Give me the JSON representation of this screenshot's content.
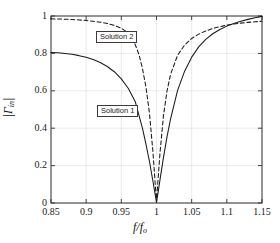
{
  "chart_data": {
    "type": "line",
    "title": "",
    "xlabel": "f/fₒ",
    "ylabel": "|Γin|",
    "xlim": [
      0.85,
      1.15
    ],
    "ylim": [
      0,
      1
    ],
    "grid": true,
    "legend_position": "inline-annotations",
    "xticks": [
      "0.85",
      "0.9",
      "0.95",
      "1",
      "1.05",
      "1.1",
      "1.15"
    ],
    "xtick_values": [
      0.85,
      0.9,
      0.95,
      1,
      1.05,
      1.1,
      1.15
    ],
    "yticks": [
      "0",
      "0.2",
      "0.4",
      "0.6",
      "0.8",
      "1"
    ],
    "ytick_values": [
      0,
      0.2,
      0.4,
      0.6,
      0.8,
      1
    ],
    "series": [
      {
        "name": "Solution 1",
        "style": "solid",
        "color": "#1a1a1a",
        "x": [
          0.85,
          0.86,
          0.87,
          0.88,
          0.89,
          0.9,
          0.91,
          0.92,
          0.93,
          0.94,
          0.95,
          0.96,
          0.97,
          0.98,
          0.985,
          0.99,
          0.995,
          0.998,
          1.0,
          1.002,
          1.005,
          1.01,
          1.015,
          1.02,
          1.03,
          1.04,
          1.05,
          1.06,
          1.07,
          1.08,
          1.09,
          1.1,
          1.11,
          1.12,
          1.13,
          1.14,
          1.15
        ],
        "y": [
          0.805,
          0.803,
          0.8,
          0.795,
          0.788,
          0.779,
          0.767,
          0.751,
          0.73,
          0.702,
          0.664,
          0.612,
          0.54,
          0.4,
          0.315,
          0.222,
          0.115,
          0.047,
          0.005,
          0.05,
          0.125,
          0.245,
          0.355,
          0.45,
          0.602,
          0.705,
          0.78,
          0.835,
          0.875,
          0.905,
          0.928,
          0.946,
          0.96,
          0.972,
          0.982,
          0.991,
          0.998
        ]
      },
      {
        "name": "Solution 2",
        "style": "dashed",
        "color": "#1a1a1a",
        "x": [
          0.85,
          0.86,
          0.87,
          0.88,
          0.89,
          0.9,
          0.91,
          0.92,
          0.93,
          0.94,
          0.95,
          0.955,
          0.96,
          0.965,
          0.97,
          0.975,
          0.98,
          0.985,
          0.99,
          0.995,
          0.998,
          1.0,
          1.002,
          1.005,
          1.01,
          1.015,
          1.02,
          1.03,
          1.04,
          1.05,
          1.06,
          1.07,
          1.08,
          1.09,
          1.1,
          1.11,
          1.12,
          1.13,
          1.14,
          1.15
        ],
        "y": [
          0.985,
          0.984,
          0.983,
          0.981,
          0.979,
          0.976,
          0.972,
          0.967,
          0.96,
          0.95,
          0.935,
          0.922,
          0.905,
          0.88,
          0.845,
          0.795,
          0.72,
          0.62,
          0.48,
          0.27,
          0.11,
          0.005,
          0.115,
          0.27,
          0.47,
          0.6,
          0.688,
          0.79,
          0.845,
          0.88,
          0.903,
          0.92,
          0.933,
          0.943,
          0.951,
          0.957,
          0.962,
          0.966,
          0.969,
          0.972
        ]
      }
    ],
    "annotations": [
      {
        "id": "solution2",
        "text": "Solution 2",
        "x": 0.945,
        "y": 0.915
      },
      {
        "id": "solution1",
        "text": "Solution 1",
        "x": 0.947,
        "y": 0.525
      }
    ]
  },
  "axis": {
    "box_color": "#333333",
    "grid_color": "#dcdcdc"
  }
}
